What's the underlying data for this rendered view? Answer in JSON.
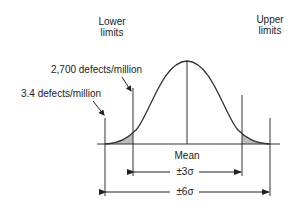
{
  "labels": {
    "lower_limits_line1": "Lower",
    "lower_limits_line2": "limits",
    "upper_limits_line1": "Upper",
    "upper_limits_line2": "limits",
    "defects_2700": "2,700 defects/million",
    "defects_3_4": "3.4 defects/million",
    "mean": "Mean",
    "three_sigma": "±3σ",
    "six_sigma": "±6σ"
  },
  "colors": {
    "line": "#333333",
    "tail_fill": "#bdbdbd",
    "background": "#ffffff"
  }
}
